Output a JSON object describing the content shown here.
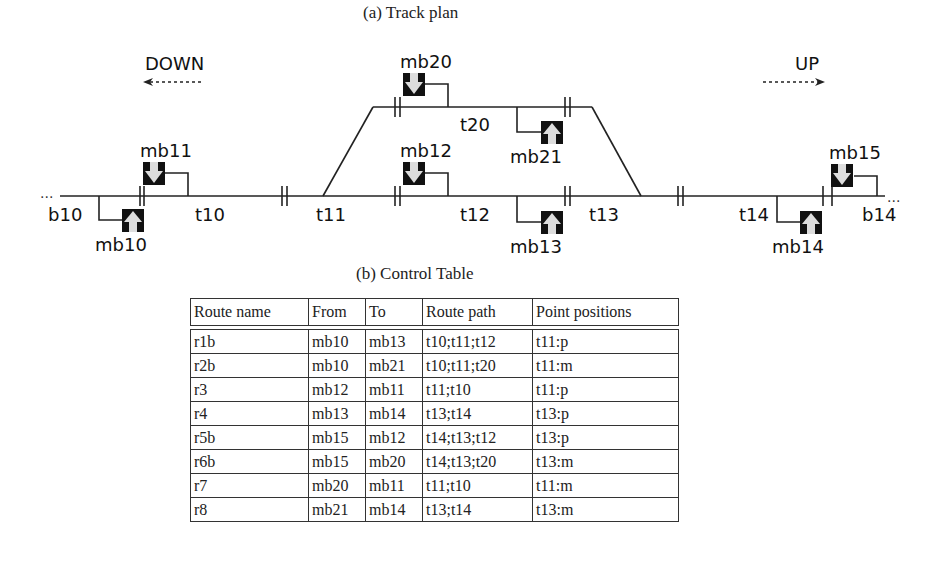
{
  "figure": {
    "track_plan_caption": "(a) Track plan",
    "control_table_caption": "(b) Control Table"
  },
  "track_plan": {
    "directions": {
      "down": {
        "label": "DOWN",
        "arrow": "left-dashed-arrow"
      },
      "up": {
        "label": "UP",
        "arrow": "right-dashed-arrow"
      }
    },
    "tracks": [
      {
        "id": "b10",
        "label": "b10"
      },
      {
        "id": "t10",
        "label": "t10"
      },
      {
        "id": "t11",
        "label": "t11"
      },
      {
        "id": "t12",
        "label": "t12"
      },
      {
        "id": "t20",
        "label": "t20"
      },
      {
        "id": "t13",
        "label": "t13"
      },
      {
        "id": "t14",
        "label": "t14"
      },
      {
        "id": "b14",
        "label": "b14"
      }
    ],
    "signals": [
      {
        "id": "mb10",
        "label": "mb10",
        "direction": "up"
      },
      {
        "id": "mb11",
        "label": "mb11",
        "direction": "down"
      },
      {
        "id": "mb12",
        "label": "mb12",
        "direction": "down"
      },
      {
        "id": "mb13",
        "label": "mb13",
        "direction": "up"
      },
      {
        "id": "mb14",
        "label": "mb14",
        "direction": "up"
      },
      {
        "id": "mb15",
        "label": "mb15",
        "direction": "down"
      },
      {
        "id": "mb20",
        "label": "mb20",
        "direction": "down"
      },
      {
        "id": "mb21",
        "label": "mb21",
        "direction": "up"
      }
    ],
    "ellipsis": "..."
  },
  "control_table": {
    "columns": [
      "Route name",
      "From",
      "To",
      "Route path",
      "Point positions"
    ],
    "rows": [
      [
        "r1b",
        "mb10",
        "mb13",
        "t10;t11;t12",
        "t11:p"
      ],
      [
        "r2b",
        "mb10",
        "mb21",
        "t10;t11;t20",
        "t11:m"
      ],
      [
        "r3",
        "mb12",
        "mb11",
        "t11;t10",
        "t11:p"
      ],
      [
        "r4",
        "mb13",
        "mb14",
        "t13;t14",
        "t13:p"
      ],
      [
        "r5b",
        "mb15",
        "mb12",
        "t14;t13;t12",
        "t13:p"
      ],
      [
        "r6b",
        "mb15",
        "mb20",
        "t14;t13;t20",
        "t13:m"
      ],
      [
        "r7",
        "mb20",
        "mb11",
        "t11;t10",
        "t11:m"
      ],
      [
        "r8",
        "mb21",
        "mb14",
        "t13;t14",
        "t13:m"
      ]
    ]
  }
}
